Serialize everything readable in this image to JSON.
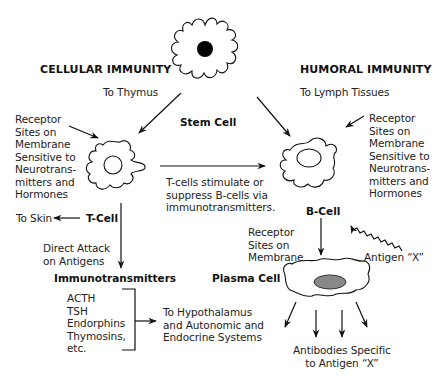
{
  "sections": {
    "cellular": "CELLULAR IMMUNITY",
    "humoral": "HUMORAL IMMUNITY"
  },
  "cells": {
    "stem": "Stem Cell",
    "t_cell": "T-Cell",
    "b_cell": "B-Cell",
    "plasma": "Plasma Cell"
  },
  "labels": {
    "to_thymus": "To Thymus",
    "to_lymph": "To Lymph Tissues",
    "receptor_left": "Receptor\nSites on\nMembrane\nSensitive to\nNeurotrans-\nmitters and\nHormones",
    "receptor_right": "Receptor\nSites on\nMembrane\nSensitive to\nNeurotrans-\nmitters and\nHormones",
    "t_stimulate": "T-cells stimulate or\nsuppress B-cells via\nimmunotransmitters.",
    "to_skin": "To Skin",
    "direct_attack": "Direct Attack\non Antigens",
    "immunotransmitters": "Immunotransmitters",
    "transmitter_list": "ACTH\nTSH\nEndorphins\nThymosins,\netc.",
    "to_hypothalamus": "To Hypothalamus\nand Autonomic and\nEndocrine Systems",
    "receptor_b": "Receptor\nSites on\nMembrane",
    "antigen": "Antigen “X”",
    "antibodies": "Antibodies Specific\nto Antigen “X”"
  },
  "colors": {
    "ink": "#111111",
    "nucleus_stem": "#000000",
    "nucleus_plasma": "#888888",
    "background": "#ffffff"
  }
}
